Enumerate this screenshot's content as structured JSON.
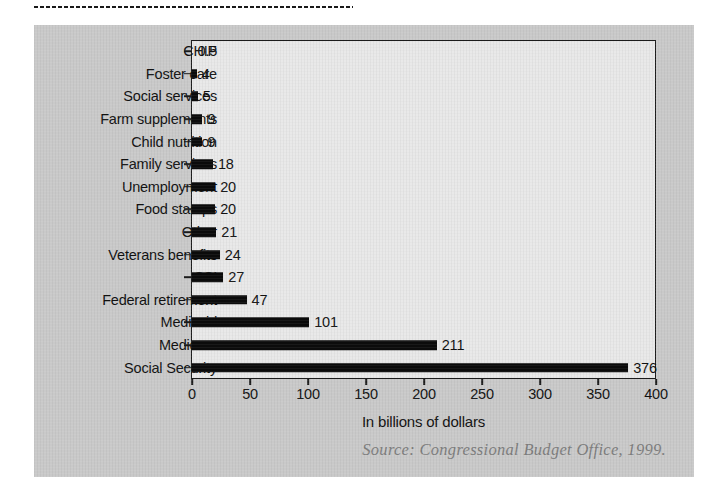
{
  "decor": {
    "dotted_rule": "dotted-rule-icon"
  },
  "chart_data": {
    "type": "bar",
    "orientation": "horizontal",
    "title": "",
    "subtitle": "",
    "xlabel": "In billions of dollars",
    "ylabel": "",
    "xlim": [
      0,
      400
    ],
    "xticks": [
      0,
      50,
      100,
      150,
      200,
      250,
      300,
      350,
      400
    ],
    "xtick_labels": [
      "0",
      "50",
      "100",
      "150",
      "200",
      "250",
      "300",
      "350",
      "400"
    ],
    "grid": false,
    "legend": null,
    "bar_color": "#0b0b0b",
    "plot_background": "#e9e9e9",
    "panel_background": "#c9c9c9",
    "categories": [
      "CHIP",
      "Foster care",
      "Social services",
      "Farm supplements",
      "Child nutrition",
      "Family services",
      "Unemployment",
      "Food stamps",
      "Other",
      "Veterans benefits",
      "SSI",
      "Federal retirement",
      "Medicaid",
      "Medicare",
      "Social Security"
    ],
    "values": [
      0.5,
      4,
      5,
      9,
      9,
      18,
      20,
      20,
      21,
      24,
      27,
      47,
      101,
      211,
      376
    ],
    "value_labels": [
      "0.5",
      "4",
      "5",
      "9",
      "9",
      "18",
      "20",
      "20",
      "21",
      "24",
      "27",
      "47",
      "101",
      "211",
      "376"
    ],
    "annotations": [
      "Source: Congressional Budget Office, 1999."
    ]
  },
  "footer": {
    "source": "Source: Congressional Budget Office, 1999."
  }
}
